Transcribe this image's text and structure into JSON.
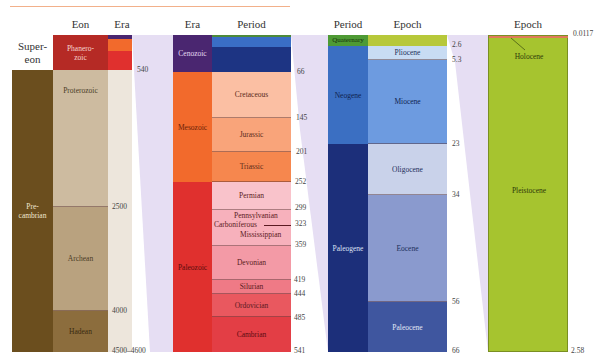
{
  "headers": {
    "supereon": "Super-\neon",
    "eon": "Eon",
    "era1": "Era",
    "era2": "Era",
    "period1": "Period",
    "period2": "Period",
    "epoch1": "Epoch",
    "epoch2": "Epoch"
  },
  "supereon": {
    "precambrian": "Pre-\ncambrian",
    "label_super": "Super-",
    "label_eon": "eon"
  },
  "eons": {
    "phanerozoic": "Phanero-\nzoic",
    "proterozoic": "Proterozoic",
    "archean": "Archean",
    "hadean": "Hadean"
  },
  "eon_ticks": {
    "t540": "540",
    "t2500": "2500",
    "t4000": "4000",
    "t4500": "4500–4600"
  },
  "eras": {
    "cenozoic": "Cenozoic",
    "mesozoic": "Mesozoic",
    "paleozoic": "Paleozoic"
  },
  "periods": {
    "cretaceous": "Cretaceous",
    "jurassic": "Jurassic",
    "triassic": "Triassic",
    "permian": "Permian",
    "pennsylvanian": "Pennsylvanian",
    "carboniferous": "Carboniferous",
    "mississippian": "Mississippian",
    "devonian": "Devonian",
    "silurian": "Silurian",
    "ordovician": "Ordovician",
    "cambrian": "Cambrian"
  },
  "period_ticks": {
    "t66": "66",
    "t145": "145",
    "t201": "201",
    "t252": "252",
    "t299": "299",
    "t323": "323",
    "t359": "359",
    "t419": "419",
    "t444": "444",
    "t485": "485",
    "t541": "541"
  },
  "cenozoic_periods": {
    "quaternary": "Quaternary",
    "neogene": "Neogene",
    "paleogene": "Paleogene"
  },
  "epochs": {
    "pliocene": "Pliocene",
    "miocene": "Miocene",
    "oligocene": "Oligocene",
    "eocene": "Eocene",
    "paleocene": "Paleocene"
  },
  "epoch_ticks": {
    "t2_6": "2.6",
    "t5_3": "5.3",
    "t23": "23",
    "t34": "34",
    "t56": "56",
    "t66": "66"
  },
  "quaternary_epochs": {
    "holocene": "Holocene",
    "pleistocene": "Pleistocene"
  },
  "quaternary_ticks": {
    "t0_0117": "0.0117",
    "t2_58": "2.58"
  },
  "colors": {
    "precambrian": "#6b4e1e",
    "phanerozoic": "#b52a25",
    "proterozoic": "#cdbba0",
    "archean": "#b9a27f",
    "hadean": "#8c6d3d",
    "cenozoic": "#4a2670",
    "mesozoic": "#f26a2c",
    "paleozoic": "#e0302e",
    "quaternary": "#9bbf2e",
    "neogene": "#3b6fc2",
    "paleogene": "#1c2f7a",
    "pleistocene": "#a6c42f",
    "wedge": "#e4dcf2",
    "accent_line": "#f2b08a"
  }
}
